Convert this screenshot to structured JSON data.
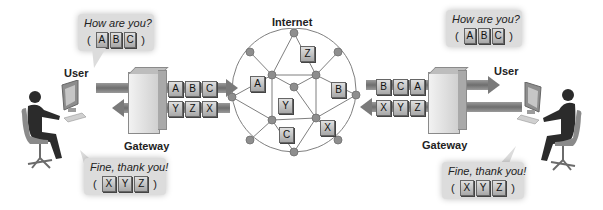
{
  "title": "Internet",
  "left": {
    "user_label": "User",
    "gateway_label": "Gateway",
    "bubble_top": {
      "text": "How are you?",
      "packets": [
        "A",
        "B",
        "C"
      ]
    },
    "bubble_bottom": {
      "text": "Fine, thank you!",
      "packets": [
        "X",
        "Y",
        "Z"
      ]
    },
    "outgoing_packets": [
      "A",
      "B",
      "C"
    ],
    "incoming_packets": [
      "Y",
      "Z",
      "X"
    ]
  },
  "right": {
    "user_label": "User",
    "gateway_label": "Gateway",
    "bubble_top": {
      "text": "How are you?",
      "packets": [
        "A",
        "B",
        "C"
      ]
    },
    "bubble_bottom": {
      "text": "Fine, thank you!",
      "packets": [
        "X",
        "Y",
        "Z"
      ]
    },
    "incoming_packets": [
      "B",
      "C",
      "A"
    ],
    "outgoing_packets": [
      "X",
      "Y",
      "Z"
    ]
  },
  "network": {
    "packets_in_transit": [
      {
        "label": "Z",
        "x": 300,
        "y": 46
      },
      {
        "label": "A",
        "x": 250,
        "y": 76
      },
      {
        "label": "B",
        "x": 331,
        "y": 82
      },
      {
        "label": "Y",
        "x": 278,
        "y": 98
      },
      {
        "label": "C",
        "x": 279,
        "y": 127
      },
      {
        "label": "X",
        "x": 320,
        "y": 120
      }
    ]
  },
  "colors": {
    "packet_fill": "#c4c4c4",
    "bubble_fill": "#dcdcdc",
    "arrow": "#7a7a7a",
    "node": "#8e8e8e",
    "line": "#7f7f7f"
  }
}
